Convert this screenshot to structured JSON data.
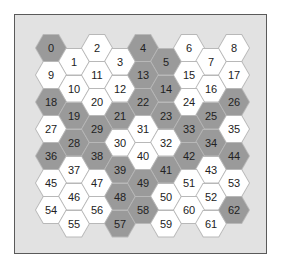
{
  "diagram": {
    "type": "hexagonal-grid",
    "columns": 9,
    "rows": 7,
    "colors": {
      "frame_bg": "#e2e2e2",
      "frame_border": "#5a5a5a",
      "white_cell": "#ffffff",
      "dark_cell": "#9a9a9a",
      "text": "#222222"
    },
    "cells": [
      {
        "id": "0",
        "shade": "dark"
      },
      {
        "id": "1",
        "shade": "white"
      },
      {
        "id": "2",
        "shade": "white"
      },
      {
        "id": "3",
        "shade": "white"
      },
      {
        "id": "4",
        "shade": "dark"
      },
      {
        "id": "5",
        "shade": "dark"
      },
      {
        "id": "6",
        "shade": "white"
      },
      {
        "id": "7",
        "shade": "white"
      },
      {
        "id": "8",
        "shade": "white"
      },
      {
        "id": "9",
        "shade": "white"
      },
      {
        "id": "10",
        "shade": "white"
      },
      {
        "id": "11",
        "shade": "white"
      },
      {
        "id": "12",
        "shade": "white"
      },
      {
        "id": "13",
        "shade": "dark"
      },
      {
        "id": "14",
        "shade": "dark"
      },
      {
        "id": "15",
        "shade": "white"
      },
      {
        "id": "16",
        "shade": "white"
      },
      {
        "id": "17",
        "shade": "white"
      },
      {
        "id": "18",
        "shade": "dark"
      },
      {
        "id": "19",
        "shade": "dark"
      },
      {
        "id": "20",
        "shade": "white"
      },
      {
        "id": "21",
        "shade": "dark"
      },
      {
        "id": "22",
        "shade": "dark"
      },
      {
        "id": "23",
        "shade": "dark"
      },
      {
        "id": "24",
        "shade": "white"
      },
      {
        "id": "25",
        "shade": "dark"
      },
      {
        "id": "26",
        "shade": "dark"
      },
      {
        "id": "27",
        "shade": "white"
      },
      {
        "id": "28",
        "shade": "dark"
      },
      {
        "id": "29",
        "shade": "dark"
      },
      {
        "id": "30",
        "shade": "white"
      },
      {
        "id": "31",
        "shade": "white"
      },
      {
        "id": "32",
        "shade": "white"
      },
      {
        "id": "33",
        "shade": "dark"
      },
      {
        "id": "34",
        "shade": "dark"
      },
      {
        "id": "35",
        "shade": "white"
      },
      {
        "id": "36",
        "shade": "dark"
      },
      {
        "id": "37",
        "shade": "white"
      },
      {
        "id": "38",
        "shade": "dark"
      },
      {
        "id": "39",
        "shade": "dark"
      },
      {
        "id": "40",
        "shade": "white"
      },
      {
        "id": "41",
        "shade": "dark"
      },
      {
        "id": "42",
        "shade": "dark"
      },
      {
        "id": "43",
        "shade": "white"
      },
      {
        "id": "44",
        "shade": "dark"
      },
      {
        "id": "45",
        "shade": "white"
      },
      {
        "id": "46",
        "shade": "white"
      },
      {
        "id": "47",
        "shade": "white"
      },
      {
        "id": "48",
        "shade": "dark"
      },
      {
        "id": "49",
        "shade": "dark"
      },
      {
        "id": "50",
        "shade": "white"
      },
      {
        "id": "51",
        "shade": "white"
      },
      {
        "id": "52",
        "shade": "white"
      },
      {
        "id": "53",
        "shade": "white"
      },
      {
        "id": "54",
        "shade": "white"
      },
      {
        "id": "55",
        "shade": "white"
      },
      {
        "id": "56",
        "shade": "white"
      },
      {
        "id": "57",
        "shade": "dark"
      },
      {
        "id": "58",
        "shade": "dark"
      },
      {
        "id": "59",
        "shade": "white"
      },
      {
        "id": "60",
        "shade": "white"
      },
      {
        "id": "61",
        "shade": "white"
      },
      {
        "id": "62",
        "shade": "dark"
      }
    ]
  }
}
